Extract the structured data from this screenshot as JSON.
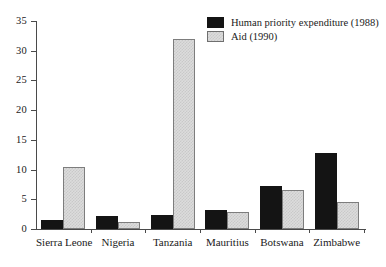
{
  "chart_data": {
    "type": "bar",
    "title": "",
    "subtitle": "",
    "xlabel": "",
    "ylabel": "",
    "ylim": [
      0,
      35
    ],
    "yticks": [
      0,
      5,
      10,
      15,
      20,
      25,
      30,
      35
    ],
    "grid": false,
    "legend_position": "top-right",
    "categories": [
      "Sierra Leone",
      "Nigeria",
      "Tanzania",
      "Mauritius",
      "Botswana",
      "Zimbabwe"
    ],
    "series": [
      {
        "name": "Human priority expenditure (1988)",
        "color": "#141414",
        "values": [
          1.5,
          2.2,
          2.4,
          3.2,
          7.2,
          12.8
        ]
      },
      {
        "name": "Aid (1990)",
        "color": "#dcdcdc",
        "values": [
          10.4,
          1.1,
          32.0,
          2.9,
          6.6,
          4.6
        ]
      }
    ]
  },
  "legend": {
    "entries": [
      {
        "label": "Human priority expenditure (1988)",
        "swatch": "dark"
      },
      {
        "label": "Aid (1990)",
        "swatch": "light"
      }
    ]
  },
  "axis": {
    "y_tick_labels": [
      "0",
      "5",
      "10",
      "15",
      "20",
      "25",
      "30",
      "35"
    ]
  }
}
